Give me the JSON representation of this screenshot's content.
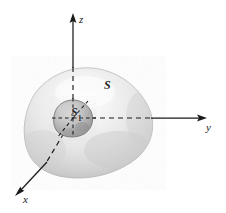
{
  "figure": {
    "background_color": "#ffffff",
    "axes": {
      "z": {
        "label": "z",
        "direction": "up",
        "arrow": true,
        "solid_from": [
          73,
          18
        ],
        "solid_to": [
          73,
          68
        ],
        "dashed_from": [
          73,
          68
        ],
        "dashed_to": [
          73,
          118
        ]
      },
      "y": {
        "label": "y",
        "direction": "right",
        "arrow": true,
        "dashed_from": [
          73,
          118
        ],
        "dashed_to": [
          152,
          118
        ],
        "solid_from": [
          152,
          118
        ],
        "solid_to": [
          202,
          118
        ]
      },
      "x": {
        "label": "x",
        "direction": "down-left",
        "arrow": true,
        "dashed_from": [
          73,
          118
        ],
        "dashed_to": [
          46,
          163
        ],
        "solid_from": [
          46,
          163
        ],
        "solid_to": [
          19,
          192
        ]
      },
      "origin": [
        73,
        118
      ]
    },
    "surfaces": [
      {
        "name": "S",
        "label": "S",
        "subscript": "",
        "type": "outer-blob",
        "fill_light": "#fbfbfb",
        "fill_mid": "#e4e4e4",
        "fill_dark": "#b4b4b4",
        "outline_color": "#a8a8a8",
        "center": [
          88,
          121
        ],
        "label_position": [
          104,
          79
        ]
      },
      {
        "name": "S1",
        "label": "S",
        "subscript": "1",
        "type": "inner-blob",
        "fill_light": "#d2d2d2",
        "fill_mid": "#b5b5b5",
        "fill_dark": "#8e8e8e",
        "outline_color": "#6f6f6f",
        "center": [
          73,
          118
        ],
        "radius": 18,
        "label_position": [
          71,
          106
        ]
      }
    ],
    "line_color": "#1a1a1a",
    "dash_pattern": "5 4"
  }
}
